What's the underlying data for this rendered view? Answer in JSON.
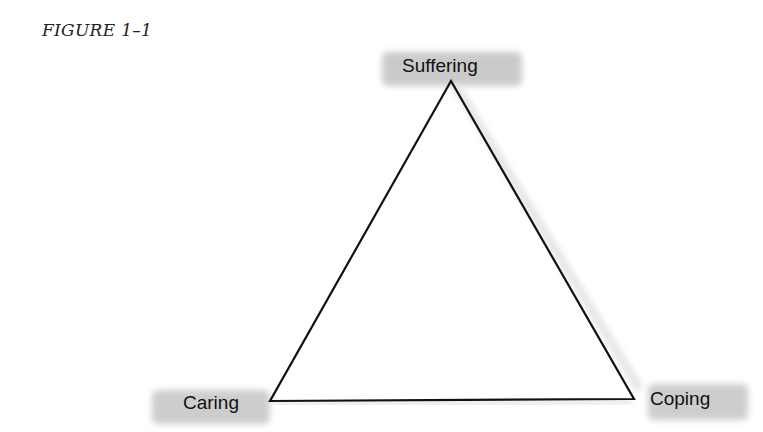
{
  "figure": {
    "caption": "FIGURE 1–1"
  },
  "diagram": {
    "shape": "triangle",
    "nodes": [
      {
        "id": "top",
        "label": "Suffering"
      },
      {
        "id": "bottom-left",
        "label": "Caring"
      },
      {
        "id": "bottom-right",
        "label": "Coping"
      }
    ],
    "edges": [
      [
        "Suffering",
        "Caring"
      ],
      [
        "Caring",
        "Coping"
      ],
      [
        "Coping",
        "Suffering"
      ]
    ],
    "highlight_color": "#b8b8b8",
    "line_color": "#111111"
  }
}
